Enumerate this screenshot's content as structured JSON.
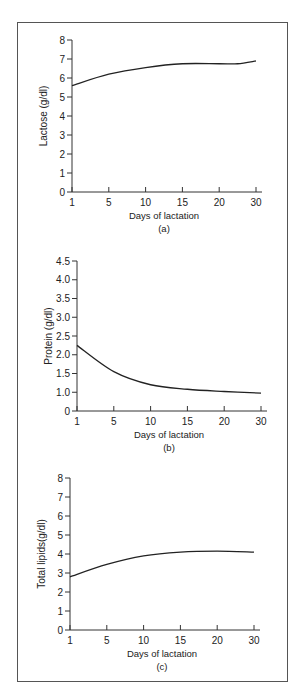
{
  "chart_data": [
    {
      "type": "line",
      "panel_label": "(a)",
      "title": "",
      "xlabel": "Days of lactation",
      "ylabel": "Lactose (g/dl)",
      "x_ticks": [
        "1",
        "5",
        "10",
        "15",
        "20",
        "30"
      ],
      "y_ticks": [
        "0",
        "1",
        "2",
        "3",
        "4",
        "5",
        "6",
        "7",
        "8"
      ],
      "ylim": [
        0,
        8
      ],
      "grid": false,
      "series": [
        {
          "name": "Lactose",
          "x": [
            1,
            5,
            10,
            15,
            20,
            25,
            30
          ],
          "values": [
            5.6,
            6.2,
            6.55,
            6.75,
            6.75,
            6.75,
            6.9
          ]
        }
      ]
    },
    {
      "type": "line",
      "panel_label": "(b)",
      "title": "",
      "xlabel": "Days of lactation",
      "ylabel": "Protein (g/dl)",
      "x_ticks": [
        "1",
        "5",
        "10",
        "15",
        "20",
        "30"
      ],
      "y_ticks": [
        "0",
        "1.0",
        "1.5",
        "2.0",
        "2.5",
        "3.0",
        "3.5",
        "4.0",
        "4.5"
      ],
      "ylim": [
        0,
        4.5
      ],
      "grid": false,
      "series": [
        {
          "name": "Protein",
          "x": [
            1,
            5,
            10,
            15,
            20,
            30
          ],
          "values": [
            2.25,
            1.55,
            1.2,
            1.08,
            1.02,
            0.95
          ]
        }
      ]
    },
    {
      "type": "line",
      "panel_label": "(c)",
      "title": "",
      "xlabel": "Days of lactation",
      "ylabel": "Total lipids(g/dl)",
      "x_ticks": [
        "1",
        "5",
        "10",
        "15",
        "20",
        "30"
      ],
      "y_ticks": [
        "0",
        "1",
        "2",
        "3",
        "4",
        "5",
        "6",
        "7",
        "8"
      ],
      "ylim": [
        0,
        8
      ],
      "grid": false,
      "series": [
        {
          "name": "Total lipids",
          "x": [
            1,
            5,
            10,
            15,
            20,
            30
          ],
          "values": [
            2.8,
            3.45,
            3.9,
            4.1,
            4.15,
            4.1
          ]
        }
      ]
    }
  ]
}
